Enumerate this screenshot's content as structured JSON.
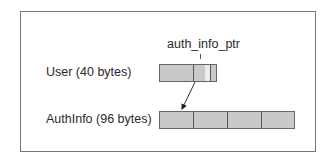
{
  "diagram": {
    "pointer_label": "auth_info_ptr",
    "user": {
      "label": "User (40 bytes)"
    },
    "authinfo": {
      "label": "AuthInfo (96 bytes)"
    },
    "colors": {
      "block_fill": "#c9c9c9",
      "block_border": "#666666",
      "pointer_slot_fill": "#ececec",
      "frame_border": "#777777"
    }
  }
}
